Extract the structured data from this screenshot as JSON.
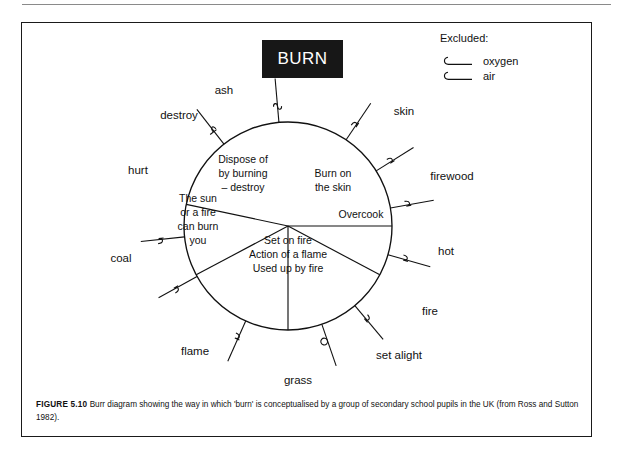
{
  "figure": {
    "title_box_label": "BURN",
    "caption_prefix": "FIGURE 5.10",
    "caption_text": "Burr diagram showing the way in which 'burn' is conceptualised by a group of secondary school pupils in the UK (from Ross and Sutton 1982).",
    "frame_color": "#1a1a1a",
    "title_box_bg": "#171717",
    "title_box_fg": "#ffffff",
    "ink_color": "#111111"
  },
  "legend": {
    "title": "Excluded:",
    "items": [
      {
        "label": "oxygen",
        "marker": "hook-line-marker"
      },
      {
        "label": "air",
        "marker": "hook-line-marker"
      }
    ]
  },
  "chart_data": {
    "type": "burr-diagram",
    "title": "BURN",
    "center": {
      "x": 267,
      "y": 204
    },
    "radius": 104,
    "segments": [
      {
        "id": "dispose",
        "lines": [
          "Dispose of",
          "by burning",
          "– destroy"
        ],
        "start_angle_deg": 270,
        "end_angle_deg": 208,
        "text_x": 222,
        "text_y": 141
      },
      {
        "id": "burn-on-skin",
        "lines": [
          "Burn on",
          "the skin"
        ],
        "start_angle_deg": 270,
        "end_angle_deg": 332,
        "text_x": 312,
        "text_y": 155
      },
      {
        "id": "overcook",
        "lines": [
          "Overcook"
        ],
        "start_angle_deg": 332,
        "end_angle_deg": 360,
        "text_x": 340,
        "text_y": 196
      },
      {
        "id": "the-sun",
        "lines": [
          "The sun",
          "or a fire",
          "can burn",
          "you"
        ],
        "start_angle_deg": 208,
        "end_angle_deg": 168,
        "text_x": 177,
        "text_y": 180
      },
      {
        "id": "set-on-fire",
        "lines": [
          "Set on fire",
          "Action of a flame",
          "Used up by fire"
        ],
        "start_angle_deg": 168,
        "end_angle_deg": 360,
        "text_x": 267,
        "text_y": 222
      }
    ],
    "spokes": [
      {
        "label": "ash",
        "angle_deg": 289,
        "label_x": 203,
        "label_y": 72,
        "anchor": "middle",
        "barb": "loop"
      },
      {
        "label": "destroy",
        "angle_deg": 246,
        "label_x": 158,
        "label_y": 97,
        "anchor": "middle",
        "barb": "hook-up"
      },
      {
        "label": "hurt",
        "angle_deg": 209,
        "label_x": 117,
        "label_y": 152,
        "anchor": "middle",
        "barb": "hook-right"
      },
      {
        "label": "coal",
        "angle_deg": 186,
        "label_x": 100,
        "label_y": 240,
        "anchor": "middle",
        "barb": "hook-right"
      },
      {
        "label": "flame",
        "angle_deg": 128,
        "label_x": 174,
        "label_y": 333,
        "anchor": "middle",
        "barb": "hook-cross"
      },
      {
        "label": "grass",
        "angle_deg": 95,
        "label_x": 277,
        "label_y": 362,
        "anchor": "middle",
        "barb": "squiggle"
      },
      {
        "label": "set alight",
        "angle_deg": 56,
        "label_x": 378,
        "label_y": 337,
        "anchor": "middle",
        "barb": "hook-left"
      },
      {
        "label": "fire",
        "angle_deg": 32,
        "label_x": 409,
        "label_y": 293,
        "anchor": "middle",
        "barb": "hook-left"
      },
      {
        "label": "hot",
        "angle_deg": 10,
        "label_x": 425,
        "label_y": 233,
        "anchor": "middle",
        "barb": "hook-left"
      },
      {
        "label": "firewood",
        "angle_deg": 344,
        "label_x": 431,
        "label_y": 158,
        "anchor": "middle",
        "barb": "hook-left"
      },
      {
        "label": "skin",
        "angle_deg": 310,
        "label_x": 383,
        "label_y": 93,
        "anchor": "middle",
        "barb": "hook-left"
      }
    ]
  }
}
